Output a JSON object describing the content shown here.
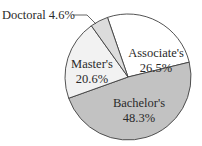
{
  "chart_data": {
    "type": "pie",
    "title": "",
    "categories": [
      "Associate's",
      "Bachelor's",
      "Master's",
      "Doctoral"
    ],
    "values": [
      26.5,
      48.3,
      20.6,
      4.6
    ],
    "unit": "%",
    "slices": [
      {
        "name": "Associate's",
        "value": 26.5,
        "label": "Associate's",
        "pct": "26.5%",
        "color": "#ffffff"
      },
      {
        "name": "Bachelor's",
        "value": 48.3,
        "label": "Bachelor's",
        "pct": "48.3%",
        "color": "#c2c2c2"
      },
      {
        "name": "Master's",
        "value": 20.6,
        "label": "Master's",
        "pct": "20.6%",
        "color": "#f2f2f2"
      },
      {
        "name": "Doctoral",
        "value": 4.6,
        "label": "Doctoral 4.6%",
        "pct": "4.6%",
        "color": "#dcdcdc"
      }
    ],
    "legend": "none",
    "annotations": [
      "Doctoral 4.6% (leader line label)"
    ],
    "stroke_color": "#404040"
  }
}
